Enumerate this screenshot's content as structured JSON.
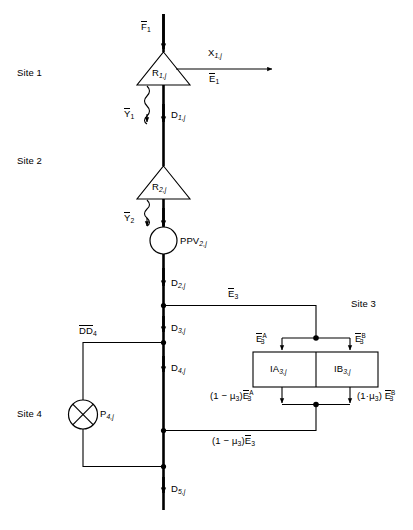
{
  "diagram": {
    "type": "block-flow-diagram",
    "title": "",
    "background_color": "#ffffff",
    "line_color": "#000000",
    "sites": [
      {
        "id": "site1",
        "label": "Site 1"
      },
      {
        "id": "site2",
        "label": "Site 2"
      },
      {
        "id": "site3",
        "label": "Site 3"
      },
      {
        "id": "site4",
        "label": "Site 4"
      }
    ],
    "nodes": {
      "r1": {
        "shape": "triangle",
        "label_base": "R",
        "label_sub": "1,j"
      },
      "r2": {
        "shape": "triangle",
        "label_base": "R",
        "label_sub": "2,j"
      },
      "ppv2": {
        "shape": "circle",
        "label_base": "PPV",
        "label_sub": "2,j"
      },
      "p4": {
        "shape": "circle-x",
        "label_base": "P",
        "label_sub": "4,j"
      },
      "ia3": {
        "shape": "box",
        "label_base": "IA",
        "label_sub": "3,j"
      },
      "ib3": {
        "shape": "box",
        "label_base": "IB",
        "label_sub": "3,j"
      }
    },
    "flows": {
      "f1": {
        "base": "F",
        "sub": "1",
        "overbar": true
      },
      "x1": {
        "base": "X",
        "sub": "1,j",
        "overbar": false
      },
      "e1": {
        "base": "E",
        "sub": "1",
        "overbar": true
      },
      "y1": {
        "base": "Y",
        "sub": "1",
        "overbar": true
      },
      "d1": {
        "base": "D",
        "sub": "1,j",
        "overbar": false
      },
      "y2": {
        "base": "Y",
        "sub": "2",
        "overbar": true
      },
      "d2": {
        "base": "D",
        "sub": "2,j",
        "overbar": false
      },
      "e3": {
        "base": "E",
        "sub": "3",
        "overbar": true
      },
      "d3": {
        "base": "D",
        "sub": "3,j",
        "overbar": false
      },
      "dd4": {
        "base": "DD",
        "sub": "4",
        "overbar": true
      },
      "d4": {
        "base": "D",
        "sub": "4,j",
        "overbar": false
      },
      "d5": {
        "base": "D",
        "sub": "5,j",
        "overbar": false
      },
      "e3a": {
        "base": "E",
        "sub": "3",
        "sup": "A",
        "overbar": true
      },
      "e3b": {
        "base": "E",
        "sub": "3",
        "sup": "B",
        "overbar": true
      },
      "out_a_prefix": "(1 − μ3)",
      "out_b_prefix": "(1·μ3)",
      "out_combined_prefix": "(1 − μ3)"
    },
    "text_labels": {
      "site1": "Site 1",
      "site2": "Site 2",
      "site3": "Site 3",
      "site4": "Site 4",
      "f1": "F1",
      "x1j": "X1,j",
      "e1": "E1",
      "r1j": "R1,j",
      "y1": "Y1",
      "d1j": "D1,j",
      "r2j": "R2,j",
      "y2": "Y2",
      "ppv2j": "PPV2,j",
      "d2j": "D2,j",
      "e3": "E3",
      "dd4": "DD4",
      "d3j": "D3,j",
      "d4j": "D4,j",
      "p4j": "P4,j",
      "d5j": "D5,j",
      "e3a": "E3A",
      "e3b": "E3B",
      "ia3j": "IA3,j",
      "ib3j": "IB3,j",
      "out_a": "(1 - μ3)E3A",
      "out_b": "(1·μ3) E3B",
      "out_c": "(1 - μ3)E3"
    }
  }
}
